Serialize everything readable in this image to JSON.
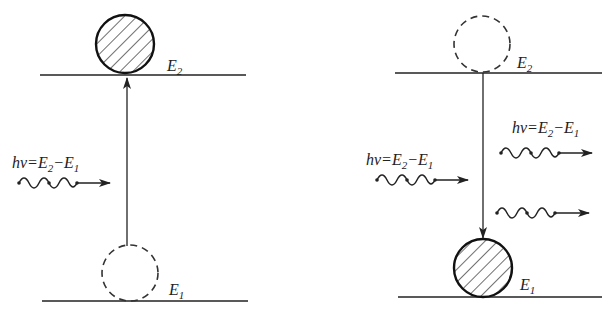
{
  "diagram": {
    "labels": {
      "e2_main": "E",
      "e2_sub": "2",
      "e1_main": "E",
      "e1_sub": "1",
      "photon_hv": "hv",
      "photon_eq": "=E",
      "photon_minus": "−E",
      "photon_sub2": "2",
      "photon_sub1": "1"
    },
    "panels": [
      {
        "id": "absorption",
        "upper_level": "E2",
        "lower_level": "E1",
        "electron_start": "E1 (dashed, empty)",
        "electron_end": "E2 (hatched, occupied)",
        "transition": "upward",
        "incident_photons": 1,
        "emitted_photons": 0,
        "photon_label": "hv=E2−E1"
      },
      {
        "id": "stimulated-emission",
        "upper_level": "E2",
        "lower_level": "E1",
        "electron_start": "E2 (dashed, empty)",
        "electron_end": "E1 (hatched, occupied)",
        "transition": "downward",
        "incident_photons": 1,
        "emitted_photons": 2,
        "photon_label": "hv=E2−E1"
      }
    ],
    "colors": {
      "ink": "#222222",
      "background": "#ffffff"
    }
  }
}
